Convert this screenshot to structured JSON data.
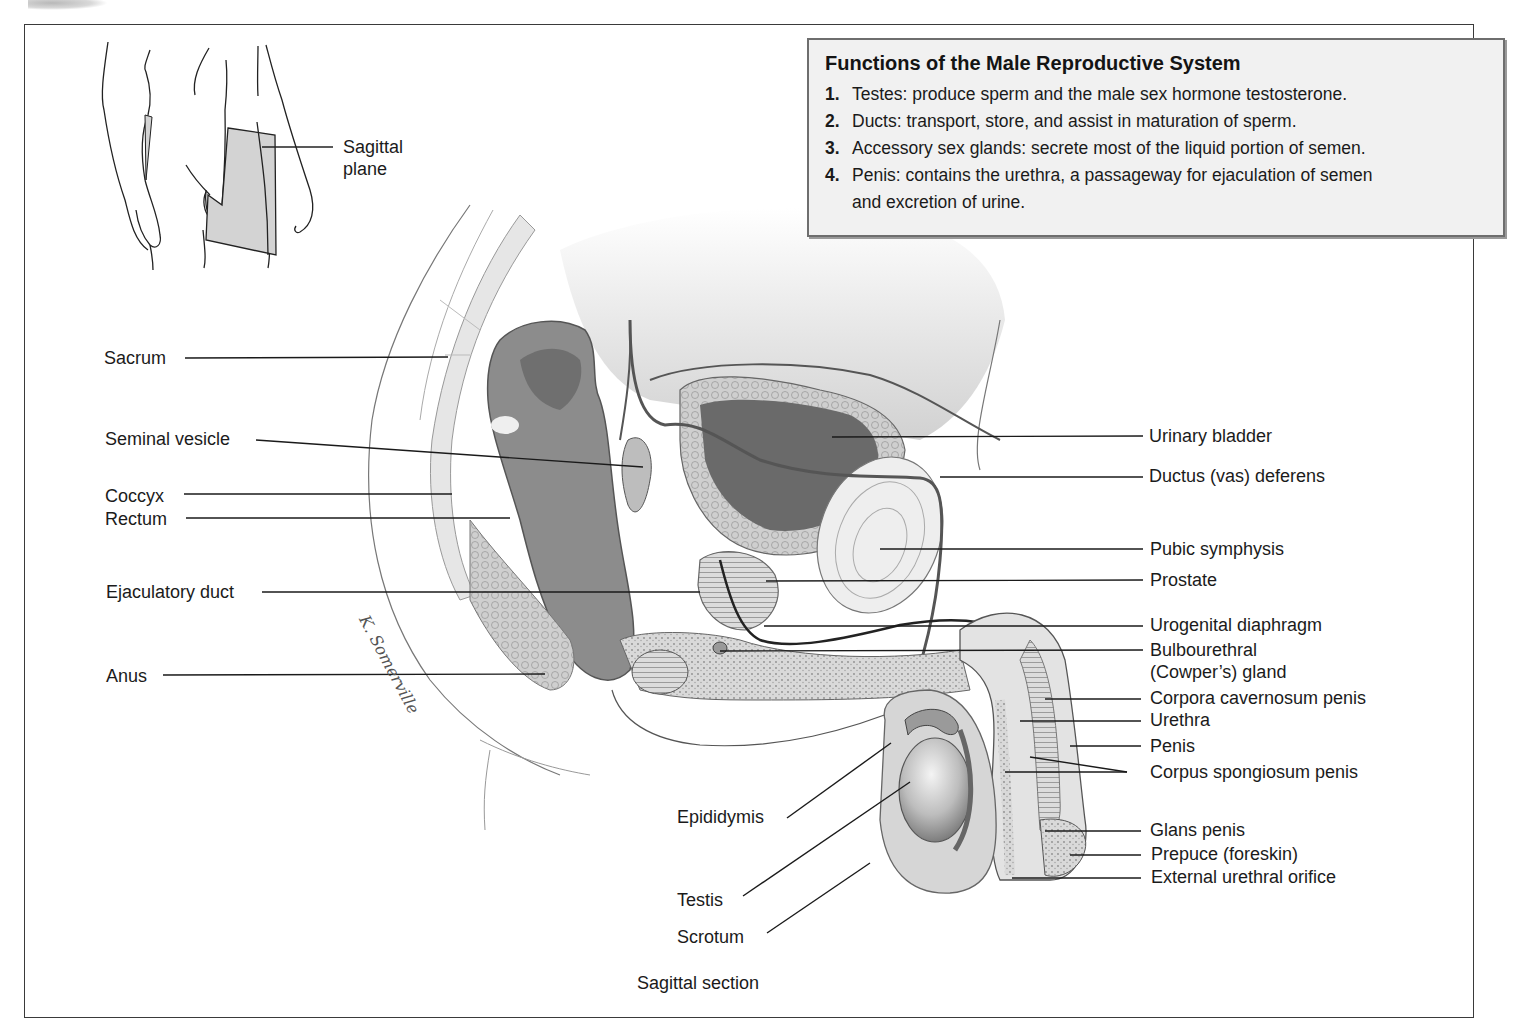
{
  "info_box": {
    "title": "Functions of the Male Reproductive System",
    "items": [
      {
        "num": "1.",
        "text": "Testes: produce sperm and the male sex hormone testosterone."
      },
      {
        "num": "2.",
        "text": "Ducts: transport, store, and assist in maturation of sperm."
      },
      {
        "num": "3.",
        "text": "Accessory sex glands: secrete most of the liquid portion of semen."
      },
      {
        "num": "4.",
        "text": "Penis: contains the urethra, a passageway for ejaculation of semen",
        "cont": "and excretion of urine."
      }
    ]
  },
  "inset": {
    "label_line1": "Sagittal",
    "label_line2": "plane"
  },
  "labels_left": {
    "sacrum": "Sacrum",
    "seminal_vesicle": "Seminal vesicle",
    "coccyx": "Coccyx",
    "rectum": "Rectum",
    "ejaculatory_duct": "Ejaculatory duct",
    "anus": "Anus"
  },
  "labels_right": {
    "urinary_bladder": "Urinary bladder",
    "ductus_deferens": "Ductus (vas) deferens",
    "pubic_symphysis": "Pubic symphysis",
    "prostate": "Prostate",
    "urogenital_diaphragm": "Urogenital diaphragm",
    "bulbourethral_1": "Bulbourethral",
    "bulbourethral_2": "(Cowper’s) gland",
    "corpora_cavernosum": "Corpora cavernosum penis",
    "urethra": "Urethra",
    "penis": "Penis",
    "corpus_spongiosum": "Corpus spongiosum penis",
    "glans_penis": "Glans penis",
    "prepuce": "Prepuce (foreskin)",
    "external_urethral_orifice": "External urethral orifice"
  },
  "labels_bottom": {
    "epididymis": "Epididymis",
    "testis": "Testis",
    "scrotum": "Scrotum"
  },
  "caption": "Sagittal section",
  "signature": "K. Somerville"
}
